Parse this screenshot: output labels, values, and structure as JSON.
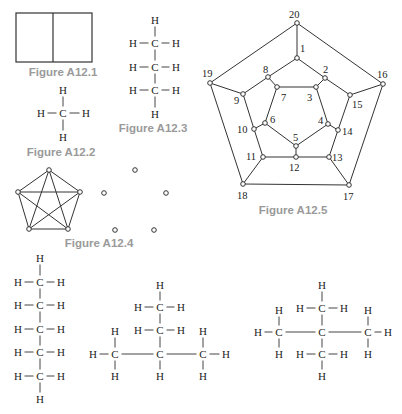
{
  "figures": [
    {
      "id": "A12.1",
      "caption": "Figure A12.1",
      "caption_pos": [
        63,
        72
      ],
      "type": "rectangle-split",
      "rect": [
        16,
        13,
        76,
        49
      ],
      "divider_x": 53
    },
    {
      "id": "A12.2",
      "caption": "Figure A12.2",
      "caption_pos": [
        61,
        152
      ],
      "type": "molecule",
      "atoms": [
        {
          "s": "H",
          "x": 63,
          "y": 90
        },
        {
          "s": "H",
          "x": 41,
          "y": 113
        },
        {
          "s": "C",
          "x": 63,
          "y": 113
        },
        {
          "s": "H",
          "x": 86,
          "y": 113
        },
        {
          "s": "H",
          "x": 63,
          "y": 137
        }
      ],
      "bonds": [
        [
          0,
          2
        ],
        [
          1,
          2
        ],
        [
          2,
          3
        ],
        [
          2,
          4
        ]
      ]
    },
    {
      "id": "A12.3",
      "caption": "Figure A12.3",
      "caption_pos": [
        153,
        128
      ],
      "type": "molecule",
      "atoms": [
        {
          "s": "H",
          "x": 155,
          "y": 20
        },
        {
          "s": "H",
          "x": 133,
          "y": 43
        },
        {
          "s": "C",
          "x": 155,
          "y": 43
        },
        {
          "s": "H",
          "x": 176,
          "y": 43
        },
        {
          "s": "H",
          "x": 133,
          "y": 67
        },
        {
          "s": "C",
          "x": 155,
          "y": 67
        },
        {
          "s": "H",
          "x": 176,
          "y": 67
        },
        {
          "s": "H",
          "x": 133,
          "y": 90
        },
        {
          "s": "C",
          "x": 155,
          "y": 90
        },
        {
          "s": "H",
          "x": 176,
          "y": 90
        },
        {
          "s": "H",
          "x": 155,
          "y": 114
        }
      ],
      "bonds": [
        [
          0,
          2
        ],
        [
          1,
          2
        ],
        [
          2,
          3
        ],
        [
          2,
          5
        ],
        [
          4,
          5
        ],
        [
          5,
          6
        ],
        [
          5,
          8
        ],
        [
          7,
          8
        ],
        [
          8,
          9
        ],
        [
          8,
          10
        ]
      ]
    },
    {
      "id": "A12.4",
      "caption": "Figure A12.4",
      "caption_pos": [
        99,
        243
      ],
      "type": "graphs",
      "complete_graph": {
        "vertices": [
          [
            49,
            170
          ],
          [
            18,
            192
          ],
          [
            80,
            192
          ],
          [
            29,
            229
          ],
          [
            68,
            229
          ]
        ],
        "edges": [
          [
            0,
            1
          ],
          [
            0,
            2
          ],
          [
            0,
            3
          ],
          [
            0,
            4
          ],
          [
            1,
            2
          ],
          [
            1,
            3
          ],
          [
            1,
            4
          ],
          [
            2,
            3
          ],
          [
            2,
            4
          ],
          [
            3,
            4
          ]
        ]
      },
      "empty_graph": {
        "vertices": [
          [
            135,
            170
          ],
          [
            104,
            193
          ],
          [
            166,
            193
          ],
          [
            115,
            230
          ],
          [
            154,
            230
          ]
        ],
        "edges": []
      }
    },
    {
      "id": "A12.5",
      "caption": "Figure A12.5",
      "caption_pos": [
        293,
        210
      ],
      "type": "graph",
      "vertices": [
        {
          "n": "1",
          "x": 297,
          "y": 58,
          "lx": 300,
          "ly": 48
        },
        {
          "n": "2",
          "x": 325,
          "y": 78,
          "lx": 323,
          "ly": 69
        },
        {
          "n": "3",
          "x": 316,
          "y": 87,
          "lx": 307,
          "ly": 97
        },
        {
          "n": "4",
          "x": 328,
          "y": 124,
          "lx": 318,
          "ly": 120
        },
        {
          "n": "5",
          "x": 296,
          "y": 146,
          "lx": 293,
          "ly": 137
        },
        {
          "n": "6",
          "x": 265,
          "y": 123,
          "lx": 270,
          "ly": 119
        },
        {
          "n": "7",
          "x": 277,
          "y": 87,
          "lx": 281,
          "ly": 97
        },
        {
          "n": "8",
          "x": 268,
          "y": 77,
          "lx": 263,
          "ly": 69
        },
        {
          "n": "9",
          "x": 243,
          "y": 94,
          "lx": 234,
          "ly": 100
        },
        {
          "n": "10",
          "x": 254,
          "y": 129,
          "lx": 237,
          "ly": 129
        },
        {
          "n": "11",
          "x": 263,
          "y": 157,
          "lx": 246,
          "ly": 156
        },
        {
          "n": "12",
          "x": 296,
          "y": 157,
          "lx": 289,
          "ly": 167
        },
        {
          "n": "13",
          "x": 329,
          "y": 157,
          "lx": 332,
          "ly": 157
        },
        {
          "n": "14",
          "x": 338,
          "y": 130,
          "lx": 342,
          "ly": 131
        },
        {
          "n": "15",
          "x": 350,
          "y": 95,
          "lx": 352,
          "ly": 104
        },
        {
          "n": "16",
          "x": 383,
          "y": 84,
          "lx": 377,
          "ly": 74
        },
        {
          "n": "17",
          "x": 349,
          "y": 185,
          "lx": 343,
          "ly": 196
        },
        {
          "n": "18",
          "x": 243,
          "y": 184,
          "lx": 237,
          "ly": 195
        },
        {
          "n": "19",
          "x": 210,
          "y": 83,
          "lx": 202,
          "ly": 73
        },
        {
          "n": "20",
          "x": 297,
          "y": 23,
          "lx": 289,
          "ly": 14
        }
      ],
      "edges": [
        [
          1,
          2
        ],
        [
          2,
          3
        ],
        [
          3,
          4
        ],
        [
          4,
          5
        ],
        [
          5,
          6
        ],
        [
          6,
          7
        ],
        [
          7,
          8
        ],
        [
          8,
          1
        ],
        [
          1,
          20
        ],
        [
          2,
          15
        ],
        [
          8,
          9
        ],
        [
          3,
          7
        ],
        [
          9,
          10
        ],
        [
          10,
          6
        ],
        [
          4,
          14
        ],
        [
          14,
          15
        ],
        [
          5,
          12
        ],
        [
          10,
          11
        ],
        [
          11,
          12
        ],
        [
          12,
          13
        ],
        [
          13,
          14
        ],
        [
          20,
          19
        ],
        [
          20,
          16
        ],
        [
          19,
          9
        ],
        [
          16,
          15
        ],
        [
          19,
          18
        ],
        [
          16,
          17
        ],
        [
          18,
          17
        ],
        [
          18,
          11
        ],
        [
          17,
          13
        ]
      ]
    },
    {
      "id": "pentane",
      "caption": "",
      "type": "molecule",
      "atoms": [
        {
          "s": "H",
          "x": 40,
          "y": 258
        },
        {
          "s": "H",
          "x": 18,
          "y": 282
        },
        {
          "s": "C",
          "x": 40,
          "y": 282
        },
        {
          "s": "H",
          "x": 61,
          "y": 282
        },
        {
          "s": "H",
          "x": 18,
          "y": 305
        },
        {
          "s": "C",
          "x": 40,
          "y": 305
        },
        {
          "s": "H",
          "x": 61,
          "y": 305
        },
        {
          "s": "H",
          "x": 18,
          "y": 329
        },
        {
          "s": "C",
          "x": 40,
          "y": 329
        },
        {
          "s": "H",
          "x": 61,
          "y": 329
        },
        {
          "s": "H",
          "x": 18,
          "y": 352
        },
        {
          "s": "C",
          "x": 40,
          "y": 352
        },
        {
          "s": "H",
          "x": 61,
          "y": 352
        },
        {
          "s": "H",
          "x": 18,
          "y": 376
        },
        {
          "s": "C",
          "x": 40,
          "y": 376
        },
        {
          "s": "H",
          "x": 61,
          "y": 376
        },
        {
          "s": "H",
          "x": 40,
          "y": 399
        }
      ],
      "bonds": [
        [
          0,
          2
        ],
        [
          1,
          2
        ],
        [
          2,
          3
        ],
        [
          2,
          5
        ],
        [
          4,
          5
        ],
        [
          5,
          6
        ],
        [
          5,
          8
        ],
        [
          7,
          8
        ],
        [
          8,
          9
        ],
        [
          8,
          11
        ],
        [
          10,
          11
        ],
        [
          11,
          12
        ],
        [
          11,
          14
        ],
        [
          13,
          14
        ],
        [
          14,
          15
        ],
        [
          14,
          16
        ]
      ]
    },
    {
      "id": "isopentane",
      "caption": "",
      "type": "molecule",
      "atoms": [
        {
          "s": "H",
          "x": 160,
          "y": 285
        },
        {
          "s": "H",
          "x": 138,
          "y": 307
        },
        {
          "s": "C",
          "x": 160,
          "y": 307
        },
        {
          "s": "H",
          "x": 181,
          "y": 307
        },
        {
          "s": "H",
          "x": 138,
          "y": 330
        },
        {
          "s": "C",
          "x": 160,
          "y": 330
        },
        {
          "s": "H",
          "x": 181,
          "y": 330
        },
        {
          "s": "H",
          "x": 115,
          "y": 331
        },
        {
          "s": "H",
          "x": 203,
          "y": 331
        },
        {
          "s": "H",
          "x": 93,
          "y": 354
        },
        {
          "s": "C",
          "x": 115,
          "y": 354
        },
        {
          "s": "C",
          "x": 160,
          "y": 354
        },
        {
          "s": "C",
          "x": 203,
          "y": 354
        },
        {
          "s": "H",
          "x": 226,
          "y": 354
        },
        {
          "s": "H",
          "x": 115,
          "y": 376
        },
        {
          "s": "H",
          "x": 160,
          "y": 376
        },
        {
          "s": "H",
          "x": 203,
          "y": 376
        }
      ],
      "bonds": [
        [
          0,
          2
        ],
        [
          1,
          2
        ],
        [
          2,
          3
        ],
        [
          2,
          5
        ],
        [
          4,
          5
        ],
        [
          5,
          6
        ],
        [
          5,
          11
        ],
        [
          7,
          10
        ],
        [
          9,
          10
        ],
        [
          10,
          11
        ],
        [
          10,
          14
        ],
        [
          11,
          12
        ],
        [
          11,
          15
        ],
        [
          12,
          13
        ],
        [
          8,
          12
        ],
        [
          12,
          16
        ]
      ]
    },
    {
      "id": "neopentane",
      "caption": "",
      "type": "molecule",
      "atoms": [
        {
          "s": "H",
          "x": 322,
          "y": 285
        },
        {
          "s": "H",
          "x": 300,
          "y": 308
        },
        {
          "s": "C",
          "x": 322,
          "y": 308
        },
        {
          "s": "H",
          "x": 344,
          "y": 308
        },
        {
          "s": "H",
          "x": 279,
          "y": 310
        },
        {
          "s": "H",
          "x": 368,
          "y": 310
        },
        {
          "s": "H",
          "x": 258,
          "y": 332
        },
        {
          "s": "C",
          "x": 279,
          "y": 332
        },
        {
          "s": "C",
          "x": 322,
          "y": 332
        },
        {
          "s": "C",
          "x": 368,
          "y": 332
        },
        {
          "s": "H",
          "x": 388,
          "y": 332
        },
        {
          "s": "H",
          "x": 279,
          "y": 354
        },
        {
          "s": "H",
          "x": 368,
          "y": 354
        },
        {
          "s": "H",
          "x": 300,
          "y": 354
        },
        {
          "s": "C",
          "x": 322,
          "y": 354
        },
        {
          "s": "H",
          "x": 344,
          "y": 354
        },
        {
          "s": "H",
          "x": 322,
          "y": 376
        }
      ],
      "bonds": [
        [
          0,
          2
        ],
        [
          1,
          2
        ],
        [
          2,
          3
        ],
        [
          2,
          8
        ],
        [
          4,
          7
        ],
        [
          6,
          7
        ],
        [
          7,
          8
        ],
        [
          7,
          11
        ],
        [
          8,
          9
        ],
        [
          8,
          14
        ],
        [
          5,
          9
        ],
        [
          9,
          10
        ],
        [
          9,
          12
        ],
        [
          13,
          14
        ],
        [
          14,
          15
        ],
        [
          14,
          16
        ]
      ]
    }
  ]
}
